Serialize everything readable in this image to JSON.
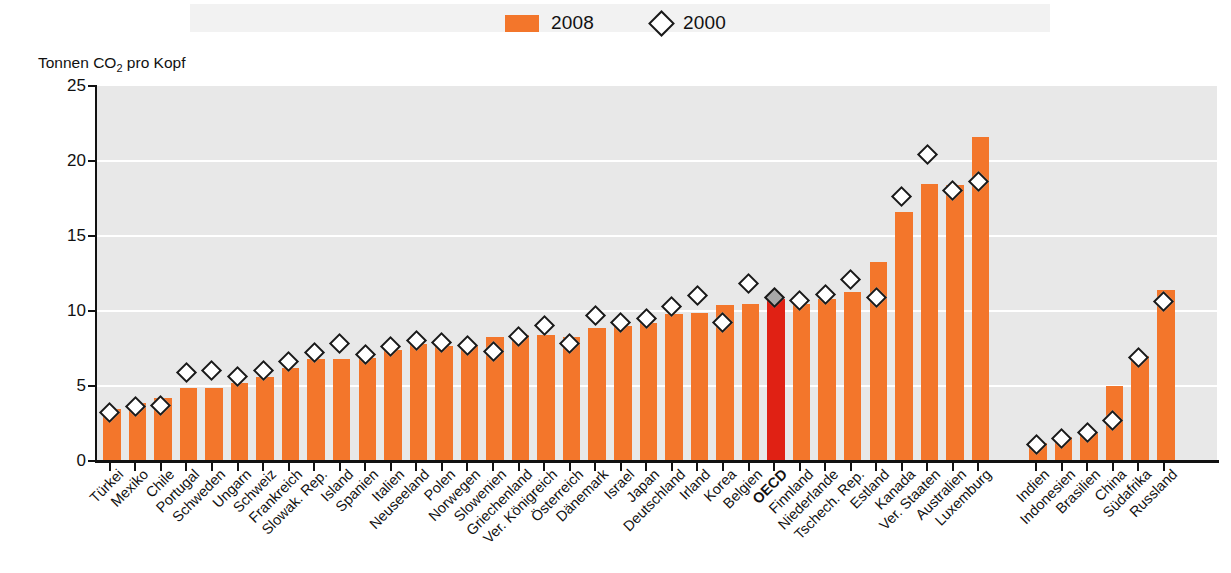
{
  "legend": {
    "items": [
      {
        "label": "2008",
        "type": "bar-swatch",
        "color": "#F3762B"
      },
      {
        "label": "2000",
        "type": "diamond-marker",
        "color": "#FFFFFF"
      }
    ]
  },
  "axis_title": "Tonnen CO",
  "axis_title_sub": "2",
  "axis_title_rest": " pro Kopf",
  "colors": {
    "bar": "#F3762B",
    "highlight_bar": "#E02114",
    "plot_background": "#E8E8E8",
    "gridline": "#FFFFFF",
    "axis": "#111111",
    "marker_fill": "#FFFFFF",
    "marker_stroke": "#1A1A1A",
    "highlight_marker_fill": "#A8A8A8"
  },
  "chart_data": {
    "type": "bar",
    "title": "",
    "subtitle": "",
    "xlabel": "",
    "ylabel": "Tonnen CO2 pro Kopf",
    "ylim": [
      0,
      25
    ],
    "yticks": [
      0,
      5,
      10,
      15,
      20,
      25
    ],
    "grid": true,
    "legend_position": "top-center",
    "categories": [
      "Türkei",
      "Mexiko",
      "Chile",
      "Portugal",
      "Schweden",
      "Ungarn",
      "Schweiz",
      "Frankreich",
      "Slowak. Rep.",
      "Island",
      "Spanien",
      "Italien",
      "Neuseeland",
      "Polen",
      "Norwegen",
      "Slowenien",
      "Griechenland",
      "Ver. Königreich",
      "Österreich",
      "Dänemark",
      "Israel",
      "Japan",
      "Deutschland",
      "Irland",
      "Korea",
      "Belgien",
      "OECD",
      "Finnland",
      "Niederlande",
      "Tschech. Rep.",
      "Estland",
      "Kanada",
      "Ver. Staaten",
      "Australien",
      "Luxemburg",
      "Indien",
      "Indonesien",
      "Brasilien",
      "China",
      "Südafrika",
      "Russland"
    ],
    "series": [
      {
        "name": "2008",
        "type": "bar",
        "values": [
          3.5,
          3.9,
          4.2,
          4.9,
          4.9,
          5.2,
          5.6,
          6.2,
          6.8,
          6.8,
          6.9,
          7.4,
          7.8,
          7.7,
          7.7,
          8.3,
          8.4,
          8.4,
          8.3,
          8.9,
          9.0,
          9.2,
          9.8,
          9.9,
          10.4,
          10.5,
          10.8,
          10.5,
          10.8,
          11.3,
          13.3,
          16.6,
          18.5,
          18.4,
          21.6,
          1.2,
          1.6,
          1.9,
          5.0,
          7.0,
          11.4
        ]
      },
      {
        "name": "2000",
        "type": "scatter-marker",
        "values": [
          3.1,
          3.5,
          3.6,
          5.8,
          5.9,
          5.5,
          5.9,
          6.5,
          7.1,
          7.7,
          7.0,
          7.5,
          7.9,
          7.8,
          7.6,
          7.2,
          8.2,
          8.9,
          7.7,
          9.6,
          9.1,
          9.4,
          10.2,
          10.9,
          9.1,
          11.7,
          10.8,
          10.6,
          11.0,
          12.0,
          10.8,
          17.5,
          20.3,
          17.9,
          18.5,
          1.0,
          1.4,
          1.8,
          2.6,
          6.8,
          10.5
        ]
      }
    ],
    "highlight_category": "OECD",
    "group_break_after": "Luxemburg"
  }
}
